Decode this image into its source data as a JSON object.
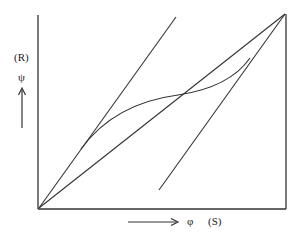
{
  "diagram": {
    "y_axis": {
      "symbol": "ψ",
      "tag": "(R)"
    },
    "x_axis": {
      "symbol": "φ",
      "tag": "(S)",
      "arrow": "⟶"
    },
    "elements": [
      {
        "id": "diagonal",
        "from": [
          39,
          208
        ],
        "to": [
          285,
          14
        ]
      },
      {
        "id": "steep-line",
        "from": [
          39,
          208
        ],
        "to": [
          176,
          17
        ]
      },
      {
        "id": "right-parallel-line",
        "from": [
          159,
          190
        ],
        "to": [
          285,
          14
        ]
      },
      {
        "id": "s-curve",
        "description": "S-shaped curve crossing the diagonal"
      }
    ],
    "colors": {
      "line": "#333333",
      "background": "#ffffff"
    }
  }
}
